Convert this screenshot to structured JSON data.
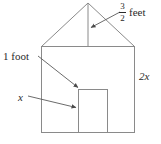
{
  "figure": {
    "name": "house-diagram",
    "background_color": "#ffffff",
    "line_color": "#8a8a8a",
    "text_color": "#2a2a2a",
    "labels": {
      "roof_height": {
        "numerator": "3",
        "denominator": "2",
        "unit": "feet",
        "full_text": "3/2 feet",
        "points_to": "roof-height-line"
      },
      "door_top": {
        "text": "1 foot",
        "points_to": "door-top-left-corner"
      },
      "door_width": {
        "text": "x",
        "points_to": "door-left-edge"
      },
      "wall_height": {
        "text": "2x",
        "points_to": "right-wall"
      }
    },
    "shapes": {
      "house_body": {
        "name": "house-body-rectangle",
        "left": 41,
        "right": 135,
        "top": 46,
        "bottom": 133
      },
      "roof": {
        "name": "roof-triangle",
        "apex_x": 88,
        "apex_y": 3,
        "base_left_x": 41,
        "base_right_x": 135,
        "base_y": 46
      },
      "roof_height_line": {
        "name": "roof-height-line",
        "x": 88,
        "y_top": 3,
        "y_bottom": 46
      },
      "door": {
        "name": "door-rectangle",
        "left": 78,
        "right": 108,
        "top": 89,
        "bottom": 133
      }
    },
    "arrows": [
      {
        "name": "roof-height-arrow",
        "from_x": 120,
        "from_y": 12,
        "to_x": 90,
        "to_y": 28
      },
      {
        "name": "one-foot-arrow",
        "from_x": 37,
        "from_y": 56,
        "to_x": 79,
        "to_y": 88
      },
      {
        "name": "x-arrow",
        "from_x": 27,
        "from_y": 96,
        "to_x": 77,
        "to_y": 108
      }
    ]
  }
}
